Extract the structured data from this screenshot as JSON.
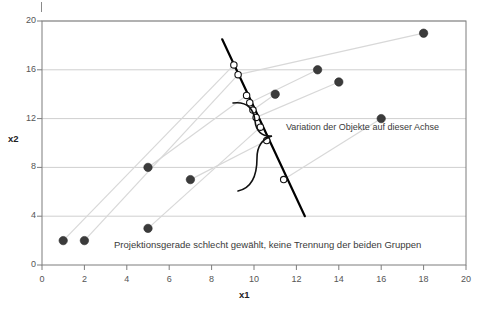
{
  "chart_data": {
    "type": "scatter",
    "title": "",
    "xlabel": "x1",
    "ylabel": "x2",
    "xlim": [
      0,
      20
    ],
    "ylim": [
      0,
      20
    ],
    "xticks": [
      0,
      2,
      4,
      6,
      8,
      10,
      12,
      14,
      16,
      18,
      20
    ],
    "yticks": [
      0,
      4,
      8,
      12,
      16,
      20
    ],
    "grid": "horizontal",
    "grid_color": "#cfcfcf",
    "point_color": "#3b3b3b",
    "projection_line_color": "#000000",
    "ray_color": "#d8d8d8",
    "series": [
      {
        "name": "Objekte",
        "points": [
          {
            "x": 1,
            "y": 2
          },
          {
            "x": 2,
            "y": 2
          },
          {
            "x": 5,
            "y": 8
          },
          {
            "x": 5,
            "y": 3
          },
          {
            "x": 7,
            "y": 7
          },
          {
            "x": 11,
            "y": 14
          },
          {
            "x": 13,
            "y": 16
          },
          {
            "x": 14,
            "y": 15
          },
          {
            "x": 16,
            "y": 12
          },
          {
            "x": 18,
            "y": 19
          }
        ]
      }
    ],
    "projection_line": {
      "label": "Projektionsgerade",
      "x_start": 8.5,
      "y_start": 18.5,
      "x_end": 12.4,
      "y_end": 4.0
    },
    "projected_points": [
      {
        "x": 9.05,
        "y": 16.4
      },
      {
        "x": 9.25,
        "y": 15.6
      },
      {
        "x": 9.65,
        "y": 13.9
      },
      {
        "x": 9.8,
        "y": 13.3
      },
      {
        "x": 9.95,
        "y": 12.7
      },
      {
        "x": 10.1,
        "y": 12.1
      },
      {
        "x": 10.3,
        "y": 11.3
      },
      {
        "x": 10.6,
        "y": 10.2
      },
      {
        "x": 11.4,
        "y": 7.0
      }
    ],
    "rays": [
      {
        "x1": 1,
        "y1": 2,
        "x2": 9.05,
        "y2": 16.4
      },
      {
        "x1": 2,
        "y1": 2,
        "x2": 9.25,
        "y2": 15.6
      },
      {
        "x1": 5,
        "y1": 8,
        "x2": 9.65,
        "y2": 13.9
      },
      {
        "x1": 5,
        "y1": 3,
        "x2": 10.3,
        "y2": 11.3
      },
      {
        "x1": 7,
        "y1": 7,
        "x2": 10.6,
        "y2": 10.2
      },
      {
        "x1": 11,
        "y1": 14,
        "x2": 9.95,
        "y2": 12.7
      },
      {
        "x1": 13,
        "y1": 16,
        "x2": 9.8,
        "y2": 13.3
      },
      {
        "x1": 14,
        "y1": 15,
        "x2": 10.1,
        "y2": 12.1
      },
      {
        "x1": 16,
        "y1": 12,
        "x2": 11.4,
        "y2": 7.0
      },
      {
        "x1": 18,
        "y1": 19,
        "x2": 9.25,
        "y2": 15.6
      }
    ],
    "annotations": [
      {
        "id": "variation-annotation",
        "text": "Variation der Objekte auf dieser Achse",
        "x": 286,
        "y": 122
      }
    ],
    "caption": {
      "text": "Projektionsgerade schlecht gewählt, keine Trennung der beiden Gruppen",
      "x": 114,
      "y": 239
    }
  },
  "axes": {
    "x": {
      "title": "x1",
      "tick_labels": [
        "0",
        "2",
        "4",
        "6",
        "8",
        "10",
        "12",
        "14",
        "16",
        "18",
        "20"
      ]
    },
    "y": {
      "title": "x2",
      "tick_labels": [
        "0",
        "4",
        "8",
        "12",
        "16",
        "20"
      ]
    }
  }
}
